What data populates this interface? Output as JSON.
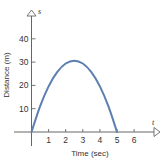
{
  "chart_data": {
    "type": "line",
    "title": "",
    "xlabel": "Time (sec)",
    "ylabel": "Distance (m)",
    "x_axis_var": "t",
    "y_axis_var": "s",
    "x_ticks": [
      "1",
      "2",
      "3",
      "4",
      "5",
      "6"
    ],
    "y_ticks": [
      "10",
      "20",
      "30",
      "40"
    ],
    "xlim": [
      0,
      7.3
    ],
    "ylim": [
      0,
      52
    ],
    "grid": false,
    "legend": null,
    "series": [
      {
        "name": "s(t)",
        "color": "#5b7fb0",
        "x": [
          0,
          0.5,
          1,
          1.5,
          2,
          2.5,
          3,
          3.5,
          4,
          4.5,
          5
        ],
        "y": [
          0,
          11.0,
          19.6,
          25.7,
          29.4,
          30.6,
          29.4,
          25.7,
          19.6,
          11.0,
          0
        ]
      }
    ]
  }
}
